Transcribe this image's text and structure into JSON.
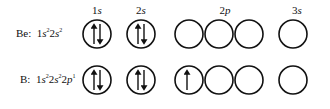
{
  "orbital_headers": [
    {
      "num": "1",
      "sub": "s",
      "x": 97
    },
    {
      "num": "2",
      "sub": "s",
      "x": 141
    },
    {
      "num": "2",
      "sub": "p",
      "x": 225
    },
    {
      "num": "3",
      "sub": "s",
      "x": 297
    }
  ],
  "rows": [
    {
      "element": "Be:",
      "config": [
        {
          "t": "1s",
          "e": "2"
        },
        {
          "t": "2s",
          "e": "2"
        }
      ],
      "y": 34,
      "orbitals": {
        "1s": "paired",
        "2s": "paired",
        "2p": [
          "empty",
          "empty",
          "empty"
        ],
        "3s": "empty"
      }
    },
    {
      "element": "B:",
      "config": [
        {
          "t": "1s",
          "e": "2"
        },
        {
          "t": "2s",
          "e": "2"
        },
        {
          "t": "2p",
          "e": "1"
        }
      ],
      "y": 80,
      "orbitals": {
        "1s": "paired",
        "2s": "paired",
        "2p": [
          "up",
          "empty",
          "empty"
        ],
        "3s": "empty"
      }
    }
  ]
}
